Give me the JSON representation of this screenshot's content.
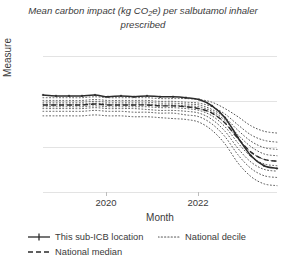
{
  "chart_data": {
    "type": "line",
    "title": "Mean carbon impact (kg CO2e) per salbutamol inhaler prescribed",
    "title_prefix": "Mean carbon impact (kg CO",
    "title_sub": "2",
    "title_suffix": "e) per salbutamol inhaler prescribed",
    "xlabel": "Month",
    "ylabel": "Measure",
    "ylim": [
      15,
      30
    ],
    "yticks": [
      30,
      25,
      20,
      15
    ],
    "xticks": [
      "2020",
      "2022"
    ],
    "xlim": [
      "2019-01",
      "2023-06"
    ],
    "grid": true,
    "legend_position": "bottom-left",
    "x": [
      "2019-01",
      "2019-04",
      "2019-07",
      "2019-10",
      "2020-01",
      "2020-04",
      "2020-07",
      "2020-10",
      "2021-01",
      "2021-04",
      "2021-07",
      "2021-10",
      "2022-01",
      "2022-04",
      "2022-07",
      "2022-10",
      "2023-01",
      "2023-04",
      "2023-06"
    ],
    "series": [
      {
        "name": "This sub-ICB location",
        "style": "solid-marker",
        "color": "#2b2b2b",
        "values": [
          25.7,
          25.6,
          25.6,
          25.6,
          25.7,
          25.5,
          25.6,
          25.5,
          25.6,
          25.5,
          25.5,
          25.4,
          25.2,
          24.5,
          23.2,
          21.0,
          19.0,
          17.9,
          17.6
        ]
      },
      {
        "name": "National median",
        "style": "dashed",
        "color": "#2b2b2b",
        "values": [
          24.6,
          24.6,
          24.6,
          24.6,
          24.7,
          24.6,
          24.6,
          24.6,
          24.6,
          24.5,
          24.5,
          24.4,
          24.2,
          23.7,
          22.6,
          20.9,
          19.4,
          18.6,
          18.4
        ]
      },
      {
        "name": "National decile",
        "style": "dotted",
        "color": "#555555",
        "deciles": [
          {
            "label": "90th",
            "values": [
              25.4,
              25.4,
              25.4,
              25.4,
              25.5,
              25.4,
              25.4,
              25.4,
              25.4,
              25.3,
              25.3,
              25.3,
              25.2,
              24.9,
              24.2,
              23.3,
              22.3,
              21.7,
              21.5
            ]
          },
          {
            "label": "80th",
            "values": [
              25.1,
              25.1,
              25.1,
              25.1,
              25.2,
              25.1,
              25.1,
              25.1,
              25.1,
              25.0,
              25.0,
              24.9,
              24.8,
              24.4,
              23.6,
              22.4,
              21.3,
              20.7,
              20.5
            ]
          },
          {
            "label": "70th",
            "values": [
              24.9,
              24.9,
              24.9,
              24.9,
              25.0,
              24.9,
              24.9,
              24.9,
              24.9,
              24.8,
              24.8,
              24.7,
              24.6,
              24.1,
              23.2,
              21.8,
              20.6,
              19.9,
              19.7
            ]
          },
          {
            "label": "60th",
            "values": [
              24.7,
              24.7,
              24.7,
              24.7,
              24.8,
              24.7,
              24.7,
              24.7,
              24.7,
              24.6,
              24.6,
              24.5,
              24.4,
              23.9,
              22.9,
              21.3,
              20.0,
              19.2,
              19.0
            ]
          },
          {
            "label": "50th",
            "values": [
              24.6,
              24.6,
              24.6,
              24.6,
              24.7,
              24.6,
              24.6,
              24.6,
              24.6,
              24.5,
              24.5,
              24.4,
              24.2,
              23.7,
              22.6,
              20.9,
              19.4,
              18.6,
              18.4
            ]
          },
          {
            "label": "40th",
            "values": [
              24.4,
              24.4,
              24.4,
              24.4,
              24.5,
              24.4,
              24.4,
              24.4,
              24.4,
              24.3,
              24.3,
              24.2,
              24.0,
              23.4,
              22.2,
              20.4,
              18.9,
              18.1,
              17.9
            ]
          },
          {
            "label": "30th",
            "values": [
              24.2,
              24.2,
              24.2,
              24.2,
              24.3,
              24.2,
              24.2,
              24.2,
              24.1,
              24.0,
              24.0,
              23.9,
              23.7,
              23.0,
              21.7,
              19.8,
              18.3,
              17.5,
              17.3
            ]
          },
          {
            "label": "20th",
            "values": [
              23.9,
              23.9,
              23.9,
              23.9,
              24.0,
              23.9,
              23.9,
              23.8,
              23.8,
              23.7,
              23.7,
              23.5,
              23.3,
              22.5,
              21.1,
              19.1,
              17.6,
              16.8,
              16.6
            ]
          },
          {
            "label": "10th",
            "values": [
              23.4,
              23.4,
              23.4,
              23.4,
              23.5,
              23.4,
              23.4,
              23.3,
              23.3,
              23.2,
              23.1,
              23.0,
              22.7,
              21.8,
              20.3,
              18.2,
              16.7,
              15.9,
              15.7
            ]
          }
        ]
      }
    ]
  },
  "legend": {
    "items": [
      {
        "label": "This sub-ICB location",
        "style": "solid-marker"
      },
      {
        "label": "National decile",
        "style": "dotted"
      },
      {
        "label": "National median",
        "style": "dashed"
      }
    ]
  },
  "axes": {
    "ylabel": "Measure",
    "xlabel": "Month",
    "yticks": [
      "30",
      "25",
      "20",
      "15"
    ],
    "xticks": [
      "2020",
      "2022"
    ]
  },
  "colors": {
    "line": "#2b2b2b",
    "decile": "#555555",
    "grid": "#e3e3e3",
    "text": "#3a3a3a",
    "background": "#ffffff"
  }
}
